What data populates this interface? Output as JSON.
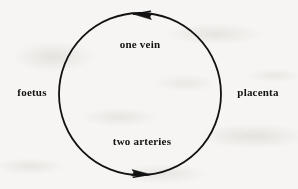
{
  "figure": {
    "background_color": "#f6f5f3",
    "ink_color": "#121212",
    "labels": {
      "top": "one vein",
      "bottom": "two arteries",
      "left": "foetus",
      "right": "placenta"
    },
    "circle": {
      "center_x": 140,
      "center_y": 94,
      "radius": 81,
      "stroke_width": 1.8
    },
    "arrows": [
      {
        "name": "top-arrowhead",
        "position": "top",
        "direction": "left",
        "tip_x": 133,
        "tip_y": 14,
        "associated_label": "one vein"
      },
      {
        "name": "bottom-arrowhead",
        "position": "bottom",
        "direction": "right",
        "tip_x": 150,
        "tip_y": 174,
        "associated_label": "two arteries"
      }
    ],
    "flow_description": "counterclockwise"
  }
}
